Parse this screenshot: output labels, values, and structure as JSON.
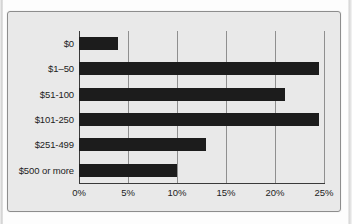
{
  "chart_data": {
    "type": "bar",
    "orientation": "horizontal",
    "title": "",
    "subtitle": "",
    "xlabel": "",
    "ylabel": "",
    "categories": [
      "$0",
      "$1–50",
      "$51-100",
      "$101-250",
      "$251-499",
      "$500 or more"
    ],
    "values": [
      4,
      24.5,
      21,
      24.5,
      13,
      10
    ],
    "tick_labels": [
      "0%",
      "5%",
      "10%",
      "15%",
      "20%",
      "25%"
    ],
    "tick_values": [
      0,
      5,
      10,
      15,
      20,
      25
    ],
    "xlim": [
      0,
      25
    ],
    "grid": "vertical",
    "legend": "none",
    "bar_color": "#1c1c1c",
    "plot_background": "#e9e9e9",
    "gridline_color": "#8f8f8f",
    "axis_color": "#3a3a3a"
  }
}
